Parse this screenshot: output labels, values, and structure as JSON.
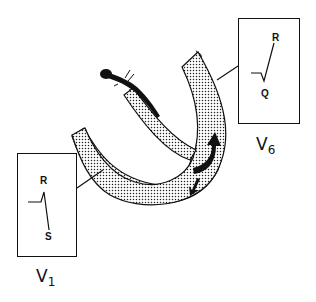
{
  "diagram": {
    "colors": {
      "ink": "#111111",
      "stipple": "#222222",
      "background": "#ffffff"
    },
    "leads": [
      {
        "id": "V1",
        "name": "V",
        "subscript": "1",
        "waves": {
          "upper": "R",
          "lower": "S"
        },
        "description": "small r then deep S"
      },
      {
        "id": "V6",
        "name": "V",
        "subscript": "6",
        "waves": {
          "upper": "R",
          "lower": "Q"
        },
        "description": "small q then tall R"
      }
    ],
    "elements": {
      "ventricle_wall": "stippled U-shaped myocardium",
      "conduction_bundle": "black bundle branch with terminal bulb",
      "arrows": [
        "septal depolarization arrow (curved, upward)",
        "small arrow (downward-left)"
      ]
    }
  }
}
